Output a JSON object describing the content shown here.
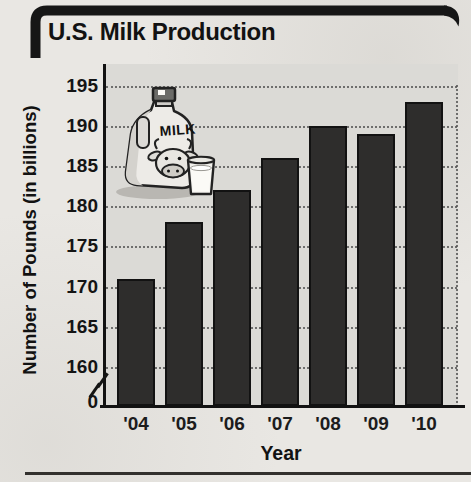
{
  "figure": {
    "title": "U.S. Milk Production"
  },
  "chart_data": {
    "type": "bar",
    "title": "U.S. Milk Production",
    "categories": [
      "'04",
      "'05",
      "'06",
      "'07",
      "'08",
      "'09",
      "'10"
    ],
    "values": [
      171,
      178,
      182,
      186,
      190,
      189,
      193
    ],
    "xlabel": "Year",
    "ylabel": "Number of Pounds (in billions)",
    "y_ticks": [
      195,
      190,
      185,
      180,
      175,
      170,
      165,
      160
    ],
    "y_origin_label": "0",
    "has_axis_break": true,
    "ylim": [
      160,
      195
    ],
    "grid": "horizontal-dotted",
    "legend": "none",
    "bar_color": "#2e2d2c",
    "plot_background": "#dbdad6",
    "accent_color": "#121212"
  },
  "illustration": {
    "name": "milk-jug-with-cow-and-glass",
    "jug_label": "MILK"
  }
}
